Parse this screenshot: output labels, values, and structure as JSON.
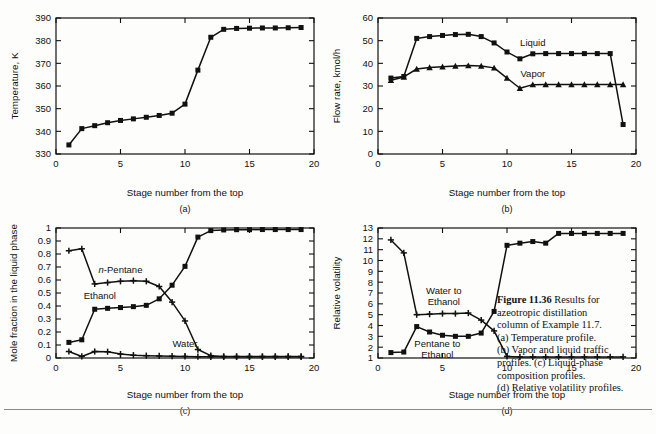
{
  "figure": {
    "number_label": "Figure 11.36",
    "caption_lines": [
      "Results for",
      "azeotropic distillation",
      "column of Example 11.7.",
      "(a) Temperature profile.",
      "(b) Vapor and liquid traffic",
      "profiles. (c) Liquid-phase",
      "composition profiles.",
      "(d) Relative volatility profiles."
    ]
  },
  "panels": {
    "a": {
      "label": "(a)"
    },
    "b": {
      "label": "(b)"
    },
    "c": {
      "label": "(c)"
    },
    "d": {
      "label": "(d)"
    }
  },
  "chart_data": [
    {
      "id": "a",
      "type": "line",
      "title": "",
      "panel_label": "(a)",
      "xlabel": "Stage number from the top",
      "ylabel": "Temperature, K",
      "xlim": [
        0,
        20
      ],
      "ylim": [
        330,
        390
      ],
      "xticks": [
        0,
        5,
        10,
        15,
        20
      ],
      "yticks": [
        330,
        340,
        350,
        360,
        370,
        380,
        390
      ],
      "xtick_labels": [
        "0",
        "5",
        "10",
        "15",
        "20"
      ],
      "ytick_labels": [
        "330",
        "340",
        "350",
        "360",
        "370",
        "380",
        "390"
      ],
      "grid": false,
      "legend": "none",
      "marker": "square",
      "x": [
        1,
        2,
        3,
        4,
        5,
        6,
        7,
        8,
        9,
        10,
        11,
        12,
        13,
        14,
        15,
        16,
        17,
        18,
        19
      ],
      "series": [
        {
          "name": "Temperature",
          "marker": "square",
          "values": [
            334.0,
            341.2,
            342.5,
            343.8,
            344.8,
            345.5,
            346.2,
            347.0,
            348.0,
            352.0,
            367.0,
            381.5,
            385.0,
            385.4,
            385.5,
            385.6,
            385.6,
            385.7,
            385.8
          ]
        }
      ]
    },
    {
      "id": "b",
      "type": "line",
      "title": "",
      "panel_label": "(b)",
      "xlabel": "Stage number from the top",
      "ylabel": "Flow rate, kmol/h",
      "xlim": [
        0,
        20
      ],
      "ylim": [
        0,
        60
      ],
      "xticks": [
        0,
        5,
        10,
        15,
        20
      ],
      "yticks": [
        0,
        10,
        20,
        30,
        40,
        50,
        60
      ],
      "xtick_labels": [
        "0",
        "5",
        "10",
        "15",
        "20"
      ],
      "ytick_labels": [
        "0",
        "10",
        "20",
        "30",
        "40",
        "50",
        "60"
      ],
      "grid": false,
      "legend": "inline-annotation",
      "x": [
        1,
        2,
        3,
        4,
        5,
        6,
        7,
        8,
        9,
        10,
        11,
        12,
        13,
        14,
        15,
        16,
        17,
        18,
        19
      ],
      "series": [
        {
          "name": "Liquid",
          "marker": "square",
          "label_x": 12.0,
          "label_y": 47.5,
          "values": [
            33.5,
            34.2,
            51.0,
            51.8,
            52.3,
            52.7,
            52.8,
            51.8,
            49.0,
            45.0,
            42.0,
            44.2,
            44.3,
            44.3,
            44.3,
            44.3,
            44.3,
            44.3,
            13.0
          ]
        },
        {
          "name": "Vapor",
          "marker": "triangle",
          "label_x": 12.0,
          "label_y": 34.0,
          "values": [
            32.5,
            34.0,
            37.5,
            38.2,
            38.5,
            38.8,
            39.0,
            38.8,
            38.0,
            33.5,
            29.0,
            30.6,
            30.7,
            30.7,
            30.7,
            30.7,
            30.7,
            30.7,
            30.7
          ]
        }
      ]
    },
    {
      "id": "c",
      "type": "line",
      "title": "",
      "panel_label": "(c)",
      "xlabel": "Stage number from the top",
      "ylabel": "Mole fraction in the liquid phase",
      "xlim": [
        0,
        20
      ],
      "ylim": [
        0,
        1
      ],
      "xticks": [
        0,
        5,
        10,
        15,
        20
      ],
      "yticks": [
        0,
        0.1,
        0.2,
        0.3,
        0.4,
        0.5,
        0.6,
        0.7,
        0.8,
        0.9,
        1
      ],
      "xtick_labels": [
        "0",
        "5",
        "10",
        "15",
        "20"
      ],
      "ytick_labels": [
        "0",
        "0.1",
        "0.2",
        "0.3",
        "0.4",
        "0.5",
        "0.6",
        "0.7",
        "0.8",
        "0.9",
        "1"
      ],
      "grid": false,
      "legend": "inline-annotation",
      "x": [
        1,
        2,
        3,
        4,
        5,
        6,
        7,
        8,
        9,
        10,
        11,
        12,
        13,
        14,
        15,
        16,
        17,
        18,
        19
      ],
      "series": [
        {
          "name": "n-Pentane",
          "name_italic_prefix": "n",
          "name_rest": "-Pentane",
          "marker": "plus",
          "label_x": 5.0,
          "label_y": 0.655,
          "values": [
            0.825,
            0.84,
            0.57,
            0.58,
            0.59,
            0.595,
            0.59,
            0.55,
            0.43,
            0.285,
            0.065,
            0.018,
            0.012,
            0.012,
            0.012,
            0.012,
            0.012,
            0.012,
            0.012
          ]
        },
        {
          "name": "Ethanol",
          "marker": "square",
          "label_x": 3.4,
          "label_y": 0.455,
          "values": [
            0.12,
            0.14,
            0.375,
            0.382,
            0.388,
            0.395,
            0.405,
            0.455,
            0.56,
            0.705,
            0.93,
            0.98,
            0.985,
            0.987,
            0.987,
            0.988,
            0.988,
            0.988,
            0.988
          ]
        },
        {
          "name": "Water",
          "marker": "plus",
          "label_x": 10.0,
          "label_y": 0.085,
          "values": [
            0.05,
            0.012,
            0.05,
            0.048,
            0.03,
            0.022,
            0.018,
            0.016,
            0.014,
            0.012,
            0.01,
            0.009,
            0.009,
            0.009,
            0.009,
            0.009,
            0.009,
            0.009,
            0.009
          ]
        }
      ]
    },
    {
      "id": "d",
      "type": "line",
      "title": "",
      "panel_label": "(d)",
      "xlabel": "Stage number from the top",
      "ylabel": "Relative volatility",
      "xlim": [
        0,
        20
      ],
      "ylim": [
        1,
        13
      ],
      "xticks": [
        0,
        5,
        10,
        15,
        20
      ],
      "yticks": [
        1,
        2,
        3,
        4,
        5,
        6,
        7,
        8,
        9,
        10,
        11,
        12,
        13
      ],
      "xtick_labels": [
        "0",
        "5",
        "10",
        "15",
        "20"
      ],
      "ytick_labels": [
        "1",
        "2",
        "3",
        "4",
        "5",
        "6",
        "7",
        "8",
        "9",
        "10",
        "11",
        "12",
        "13"
      ],
      "grid": false,
      "legend": "inline-annotation",
      "x": [
        1,
        2,
        3,
        4,
        5,
        6,
        7,
        8,
        9,
        10,
        11,
        12,
        13,
        14,
        15,
        16,
        17,
        18,
        19
      ],
      "series": [
        {
          "name": "Water to Ethanol",
          "name_line1": "Water to",
          "name_line2": "Ethanol",
          "marker": "plus",
          "label_x": 5.1,
          "label_y": 6.9,
          "values": [
            11.9,
            10.7,
            5.0,
            5.05,
            5.1,
            5.1,
            5.15,
            4.5,
            3.5,
            1.15,
            1.1,
            1.1,
            1.1,
            1.1,
            1.1,
            1.1,
            1.1,
            1.1,
            1.1
          ]
        },
        {
          "name": "Pentane to Ethanol",
          "name_line1": "Pentane to",
          "name_line2": "Ethanol",
          "marker": "square",
          "label_x": 4.6,
          "label_y": 2.0,
          "values": [
            1.5,
            1.55,
            3.9,
            3.4,
            3.1,
            3.0,
            3.0,
            3.3,
            5.3,
            11.4,
            11.6,
            11.75,
            11.6,
            12.5,
            12.5,
            12.5,
            12.5,
            12.5,
            12.5
          ]
        }
      ]
    }
  ]
}
